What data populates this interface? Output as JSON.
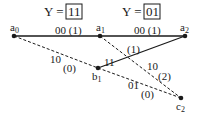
{
  "headers": [
    {
      "prefix": "Y =",
      "value": "11"
    },
    {
      "prefix": "Y =",
      "value": "01"
    }
  ],
  "nodes": {
    "a0": {
      "label": "a",
      "sub": "0"
    },
    "a1": {
      "label": "a",
      "sub": "1"
    },
    "a2": {
      "label": "a",
      "sub": "2"
    },
    "b1": {
      "label": "b",
      "sub": "1"
    },
    "c2": {
      "label": "c",
      "sub": "2"
    }
  },
  "edges": {
    "a0_a1": {
      "code": "00",
      "metric": "(1)",
      "style": "solid"
    },
    "a1_a2": {
      "code": "00",
      "metric": "(1)",
      "style": "solid"
    },
    "a0_b1": {
      "code": "10",
      "metric": "(0)",
      "style": "dashed"
    },
    "b1_a2": {
      "code": "11",
      "metric": "(1)",
      "style": "solid"
    },
    "a1_c2": {
      "code": "10",
      "metric": "(2)",
      "style": "dashed"
    },
    "b1_c2": {
      "code": "01",
      "metric": "(0)",
      "style": "dashed"
    }
  }
}
